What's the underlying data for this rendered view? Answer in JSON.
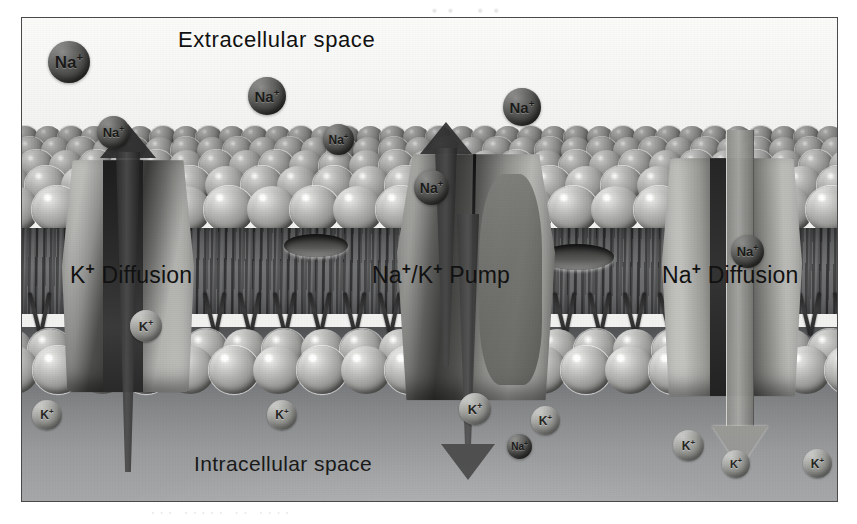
{
  "figure": {
    "caption_regions": {
      "extracellular_label": "Extracellular space",
      "intracellular_label": "Intracellular space"
    },
    "transport_labels": {
      "k_diffusion": "K+ Diffusion",
      "na_k_pump": "Na+/K+ Pump",
      "na_diffusion": "Na+ Diffusion"
    },
    "ion_labels": {
      "sodium": "Na+",
      "potassium": "K+"
    },
    "colors": {
      "frame_border": "#4a4a4a",
      "extracellular_bg": "#f6f6f4",
      "intracellular_bg": "#87898b",
      "membrane_head": "#8d8d8b",
      "membrane_tail": "#3c3d3e",
      "sodium_ion": "#4b4b49",
      "potassium_ion": "#a8a8a5",
      "label_text": "#121212"
    }
  },
  "ions": {
    "extracellular_sodium": [
      {
        "label": "Na",
        "charge": "+",
        "x": 26,
        "y": 23,
        "size": 42
      },
      {
        "label": "Na",
        "charge": "+",
        "x": 75,
        "y": 98,
        "size": 33
      },
      {
        "label": "Na",
        "charge": "+",
        "x": 226,
        "y": 59,
        "size": 38
      },
      {
        "label": "Na",
        "charge": "+",
        "x": 301,
        "y": 106,
        "size": 31
      },
      {
        "label": "Na",
        "charge": "+",
        "x": 392,
        "y": 152,
        "size": 35
      },
      {
        "label": "Na",
        "charge": "+",
        "x": 481,
        "y": 70,
        "size": 38
      },
      {
        "label": "Na",
        "charge": "+",
        "x": 709,
        "y": 217,
        "size": 33
      }
    ],
    "intracellular_potassium": [
      {
        "label": "K",
        "charge": "+",
        "x": 10,
        "y": 382,
        "size": 30
      },
      {
        "label": "K",
        "charge": "+",
        "x": 108,
        "y": 292,
        "size": 32
      },
      {
        "label": "K",
        "charge": "+",
        "x": 245,
        "y": 382,
        "size": 30
      },
      {
        "label": "K",
        "charge": "+",
        "x": 437,
        "y": 375,
        "size": 32
      },
      {
        "label": "K",
        "charge": "+",
        "x": 509,
        "y": 388,
        "size": 29
      },
      {
        "label": "K",
        "charge": "+",
        "x": 651,
        "y": 412,
        "size": 31
      },
      {
        "label": "K",
        "charge": "+",
        "x": 700,
        "y": 432,
        "size": 28
      },
      {
        "label": "K",
        "charge": "+",
        "x": 781,
        "y": 431,
        "size": 29
      }
    ],
    "intracellular_sodium": [
      {
        "label": "Na",
        "charge": "+",
        "x": 485,
        "y": 416,
        "size": 25
      }
    ]
  },
  "page_showthrough": {
    "top": "·· ··",
    "right_line_1": "······ ······ · ·· ·",
    "right_line_2": "····· ····· ··· ········",
    "bottom": "··· ····· ·· ····"
  }
}
